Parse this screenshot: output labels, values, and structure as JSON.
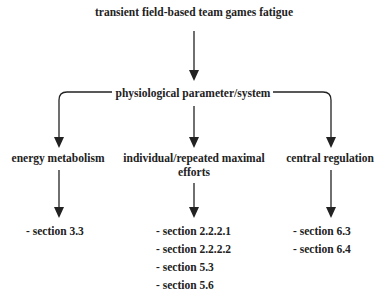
{
  "diagram": {
    "root": {
      "label": "transient field-based team games fatigue"
    },
    "level1": {
      "label": "physiological parameter/system"
    },
    "branches": [
      {
        "label": "energy metabolism",
        "sections": [
          "- section 3.3"
        ]
      },
      {
        "label": "individual/repeated maximal",
        "label_line2": "efforts",
        "sections": [
          "- section 2.2.2.1",
          "- section 2.2.2.2",
          "- section 5.3",
          "- section 5.6"
        ]
      },
      {
        "label": "central regulation",
        "sections": [
          "- section 6.3",
          "- section 6.4"
        ]
      }
    ],
    "colors": {
      "line": "#222222",
      "text": "#222222",
      "background": "#ffffff"
    }
  }
}
